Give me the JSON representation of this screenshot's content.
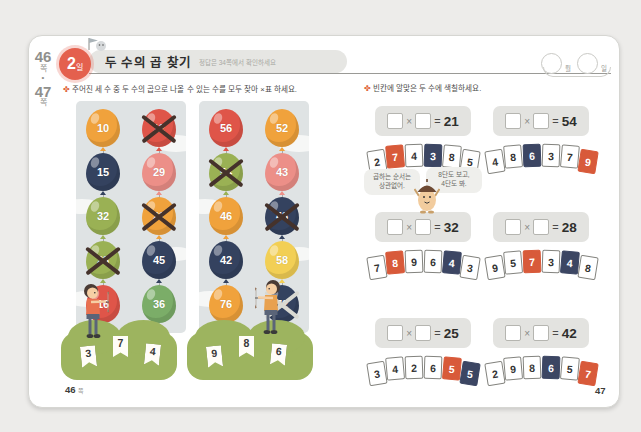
{
  "page_tab": {
    "top_num": "46",
    "top_suffix": "쪽",
    "separator": "•",
    "bottom_num": "47",
    "bottom_suffix": "쪽"
  },
  "header": {
    "day_number": "2",
    "day_suffix": "일",
    "title": "두 수의 곱 찾기",
    "subtitle": "정답은 34쪽에서 확인하세요"
  },
  "date_widget": {
    "month_label": "월",
    "day_label": "일"
  },
  "left": {
    "bullet": "✤",
    "instruction": "주어진 세 수 중 두 수의 곱으로 나올 수 있는 수를 모두 찾아 ×표 하세요.",
    "panels": [
      {
        "balloons": [
          {
            "n": "10",
            "c": "#f0a23c",
            "x": false
          },
          {
            "n": "12",
            "c": "#df5549",
            "x": true
          },
          {
            "n": "15",
            "c": "#34425f",
            "x": false
          },
          {
            "n": "29",
            "c": "#ec8f88",
            "x": false
          },
          {
            "n": "32",
            "c": "#9ab154",
            "x": false
          },
          {
            "n": "21",
            "c": "#f0a23c",
            "x": true
          },
          {
            "n": "28",
            "c": "#9ab154",
            "x": true
          },
          {
            "n": "45",
            "c": "#34425f",
            "x": false
          },
          {
            "n": "16",
            "c": "#df5549",
            "x": false
          },
          {
            "n": "36",
            "c": "#7bad68",
            "x": false
          }
        ],
        "given_numbers": [
          "3",
          "7",
          "4"
        ]
      },
      {
        "balloons": [
          {
            "n": "56",
            "c": "#df5549",
            "x": false
          },
          {
            "n": "52",
            "c": "#f0a23c",
            "x": false
          },
          {
            "n": "54",
            "c": "#9ab154",
            "x": true
          },
          {
            "n": "43",
            "c": "#ec8f88",
            "x": false
          },
          {
            "n": "46",
            "c": "#f0a23c",
            "x": false
          },
          {
            "n": "48",
            "c": "#34425f",
            "x": true
          },
          {
            "n": "42",
            "c": "#34425f",
            "x": false
          },
          {
            "n": "58",
            "c": "#f2cf55",
            "x": false
          },
          {
            "n": "76",
            "c": "#f0a23c",
            "x": false
          },
          {
            "n": "72",
            "c": "#34425f",
            "x": true,
            "light_x": true
          }
        ],
        "given_numbers": [
          "9",
          "8",
          "6"
        ]
      }
    ]
  },
  "right": {
    "bullet": "✤",
    "instruction": "빈칸에 알맞은 두 수에 색칠하세요.",
    "bubble1": [
      "곱하는 순서는",
      "상관없어."
    ],
    "bubble2": [
      "8단도 보고,",
      "4단도 봐."
    ],
    "multiply_sign": "×",
    "equals_sign": "=",
    "problems": [
      {
        "result": "21",
        "cards": [
          {
            "n": "2"
          },
          {
            "n": "7",
            "hl": "#d85a3a"
          },
          {
            "n": "4"
          },
          {
            "n": "3",
            "hl": "#3c4663"
          },
          {
            "n": "8"
          },
          {
            "n": "5"
          }
        ]
      },
      {
        "result": "54",
        "cards": [
          {
            "n": "4"
          },
          {
            "n": "8"
          },
          {
            "n": "6",
            "hl": "#3c4663"
          },
          {
            "n": "3"
          },
          {
            "n": "7"
          },
          {
            "n": "9",
            "hl": "#d85a3a"
          }
        ]
      },
      {
        "result": "32",
        "cards": [
          {
            "n": "7"
          },
          {
            "n": "8",
            "hl": "#d85a3a"
          },
          {
            "n": "9"
          },
          {
            "n": "6"
          },
          {
            "n": "4",
            "hl": "#3c4663"
          },
          {
            "n": "3"
          }
        ]
      },
      {
        "result": "28",
        "cards": [
          {
            "n": "9"
          },
          {
            "n": "5"
          },
          {
            "n": "7",
            "hl": "#d85a3a"
          },
          {
            "n": "3"
          },
          {
            "n": "4",
            "hl": "#3c4663"
          },
          {
            "n": "8"
          }
        ]
      },
      {
        "result": "25",
        "cards": [
          {
            "n": "3"
          },
          {
            "n": "4"
          },
          {
            "n": "2"
          },
          {
            "n": "6"
          },
          {
            "n": "5",
            "hl": "#d85a3a"
          },
          {
            "n": "5",
            "hl": "#3c4663"
          }
        ]
      },
      {
        "result": "42",
        "cards": [
          {
            "n": "2"
          },
          {
            "n": "9"
          },
          {
            "n": "8"
          },
          {
            "n": "6",
            "hl": "#3c4663"
          },
          {
            "n": "5"
          },
          {
            "n": "7",
            "hl": "#d85a3a"
          }
        ]
      }
    ]
  },
  "footer": {
    "left_page": "46",
    "left_suffix": "쪽",
    "right_page": "47"
  },
  "colors": {
    "badge": "#e4604e",
    "highlight_red": "#d85a3a",
    "highlight_navy": "#3c4663",
    "panel_bg": "#dfe3e4",
    "mound_green": "#9db45f"
  }
}
